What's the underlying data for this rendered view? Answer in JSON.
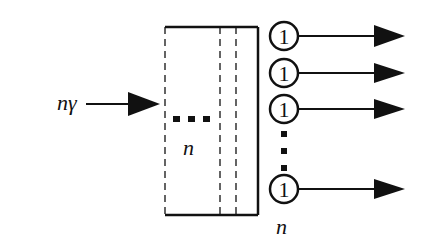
{
  "diagram": {
    "input_label": "nγ",
    "inner_label": "n",
    "bottom_label": "n",
    "output_node_label": "1",
    "output_nodes": [
      {
        "label": "1",
        "cy": 36
      },
      {
        "label": "1",
        "cy": 73
      },
      {
        "label": "1",
        "cy": 109
      },
      {
        "label": "1",
        "cy": 189
      }
    ],
    "colors": {
      "stroke": "#111111",
      "background": "#ffffff"
    }
  }
}
